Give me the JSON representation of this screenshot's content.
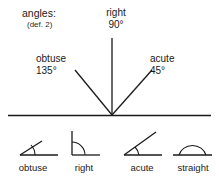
{
  "figure": {
    "title": "angles:",
    "subtitle": "(def. 2)",
    "width": 219,
    "height": 182,
    "background": "#ffffff",
    "stroke_color": "#1a1a1a",
    "text_color": "#1a1a1a"
  },
  "main_diagram": {
    "baseline": {
      "x1": 8,
      "y1": 115,
      "x2": 211,
      "y2": 115
    },
    "vertex": {
      "x": 112,
      "y": 115
    },
    "rays": [
      {
        "name": "obtuse-ray",
        "label": "obtuse",
        "value": "135°",
        "angle_degrees": 135,
        "x1": 112,
        "y1": 115,
        "x2": 75,
        "y2": 70
      },
      {
        "name": "right-ray",
        "label": "right",
        "value": "90°",
        "angle_degrees": 90,
        "x1": 112,
        "y1": 115,
        "x2": 112,
        "y2": 38
      },
      {
        "name": "acute-ray",
        "label": "acute",
        "value": "45°",
        "angle_degrees": 45,
        "x1": 112,
        "y1": 115,
        "x2": 152,
        "y2": 70
      }
    ]
  },
  "icons": [
    {
      "name": "obtuse-icon",
      "label": "obtuse",
      "angle_degrees": 135,
      "baseline": {
        "x1": 20,
        "y1": 155,
        "x2": 58,
        "y2": 155
      },
      "ray": {
        "x1": 20,
        "y1": 155,
        "x2": 42,
        "y2": 141
      },
      "arc": {
        "rx": 13,
        "ry": 13,
        "sx": 33,
        "sy": 147,
        "ex": 33,
        "ey": 155
      }
    },
    {
      "name": "right-icon",
      "label": "right",
      "angle_degrees": 90,
      "baseline": {
        "x1": 72,
        "y1": 155,
        "x2": 100,
        "y2": 155
      },
      "ray": {
        "x1": 72,
        "y1": 155,
        "x2": 72,
        "y2": 131
      },
      "arc": {
        "rx": 12,
        "ry": 12,
        "sx": 72,
        "sy": 143,
        "ex": 84,
        "ey": 155
      }
    },
    {
      "name": "acute-icon",
      "label": "acute",
      "angle_degrees": 45,
      "baseline": {
        "x1": 124,
        "y1": 155,
        "x2": 162,
        "y2": 155
      },
      "ray": {
        "x1": 124,
        "y1": 155,
        "x2": 156,
        "y2": 132
      },
      "arc": {
        "rx": 14,
        "ry": 14,
        "sx": 135,
        "sy": 147,
        "ex": 138,
        "ey": 155
      }
    },
    {
      "name": "straight-icon",
      "label": "straight",
      "angle_degrees": 180,
      "baseline": {
        "x1": 173,
        "y1": 155,
        "x2": 212,
        "y2": 155
      },
      "ray": null,
      "arc": {
        "rx": 14,
        "ry": 12,
        "sx": 179,
        "sy": 155,
        "ex": 206,
        "ey": 155
      }
    }
  ]
}
